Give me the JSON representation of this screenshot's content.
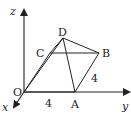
{
  "diagram": {
    "type": "3d-coordinate-pyramid",
    "axes": {
      "x_label": "x",
      "y_label": "y",
      "z_label": "z"
    },
    "points": {
      "O": {
        "label": "O"
      },
      "A": {
        "label": "A"
      },
      "B": {
        "label": "B"
      },
      "C": {
        "label": "C"
      },
      "D": {
        "label": "D"
      }
    },
    "edges": [
      "O-A",
      "A-B",
      "B-C",
      "C-O",
      "D-O",
      "D-A",
      "D-B",
      "D-C"
    ],
    "measures": {
      "OA": "4",
      "AB": "4"
    }
  }
}
